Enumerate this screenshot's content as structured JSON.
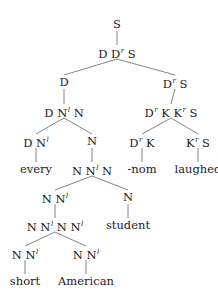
{
  "diagram": {
    "type": "syntax-tree",
    "nodes": [
      {
        "id": "root",
        "label": "S",
        "x": 117,
        "y": 24
      },
      {
        "id": "n1",
        "label": "D D<sup>r</sup> S",
        "x": 117,
        "y": 52
      },
      {
        "id": "n2",
        "label": "D",
        "x": 64,
        "y": 82
      },
      {
        "id": "n3",
        "label": "D<sup>r</sup> S",
        "x": 175,
        "y": 82
      },
      {
        "id": "n4",
        "label": "D N<sup>l</sup> N",
        "x": 64,
        "y": 111
      },
      {
        "id": "n5",
        "label": "D<sup>r</sup> K K<sup>r</sup> S",
        "x": 171,
        "y": 111
      },
      {
        "id": "n6",
        "label": "D N<sup>l</sup>",
        "x": 36,
        "y": 141
      },
      {
        "id": "n7",
        "label": "N",
        "x": 92,
        "y": 141
      },
      {
        "id": "n8",
        "label": "D<sup>r</sup> K",
        "x": 142,
        "y": 141
      },
      {
        "id": "n9",
        "label": "K<sup>r</sup> S",
        "x": 198,
        "y": 141
      },
      {
        "id": "n10",
        "label": "every",
        "x": 36,
        "y": 169
      },
      {
        "id": "n11",
        "label": "N N<sup>l</sup> N",
        "x": 92,
        "y": 169
      },
      {
        "id": "n12",
        "label": "-nom",
        "x": 142,
        "y": 169
      },
      {
        "id": "n13",
        "label": "laughed",
        "x": 198,
        "y": 169
      },
      {
        "id": "n14",
        "label": "N N<sup>l</sup>",
        "x": 55,
        "y": 197
      },
      {
        "id": "n15",
        "label": "N",
        "x": 128,
        "y": 197
      },
      {
        "id": "n16",
        "label": "N N<sup>l</sup> N N<sup>l</sup>",
        "x": 55,
        "y": 225
      },
      {
        "id": "n17",
        "label": "student",
        "x": 128,
        "y": 225
      },
      {
        "id": "n18",
        "label": "N N<sup>l</sup>",
        "x": 25,
        "y": 253
      },
      {
        "id": "n19",
        "label": "N N<sup>l</sup>",
        "x": 86,
        "y": 253
      },
      {
        "id": "n20",
        "label": "short",
        "x": 25,
        "y": 281
      },
      {
        "id": "n21",
        "label": "American",
        "x": 86,
        "y": 281
      }
    ],
    "edges": [
      [
        "root",
        "n1"
      ],
      [
        "n1",
        "n2"
      ],
      [
        "n1",
        "n3"
      ],
      [
        "n2",
        "n4"
      ],
      [
        "n3",
        "n5"
      ],
      [
        "n4",
        "n6"
      ],
      [
        "n4",
        "n7"
      ],
      [
        "n5",
        "n8"
      ],
      [
        "n5",
        "n9"
      ],
      [
        "n6",
        "n10"
      ],
      [
        "n7",
        "n11"
      ],
      [
        "n8",
        "n12"
      ],
      [
        "n9",
        "n13"
      ],
      [
        "n11",
        "n14"
      ],
      [
        "n11",
        "n15"
      ],
      [
        "n14",
        "n16"
      ],
      [
        "n15",
        "n17"
      ],
      [
        "n16",
        "n18"
      ],
      [
        "n16",
        "n19"
      ],
      [
        "n18",
        "n20"
      ],
      [
        "n19",
        "n21"
      ]
    ],
    "line_color": "#666666"
  }
}
